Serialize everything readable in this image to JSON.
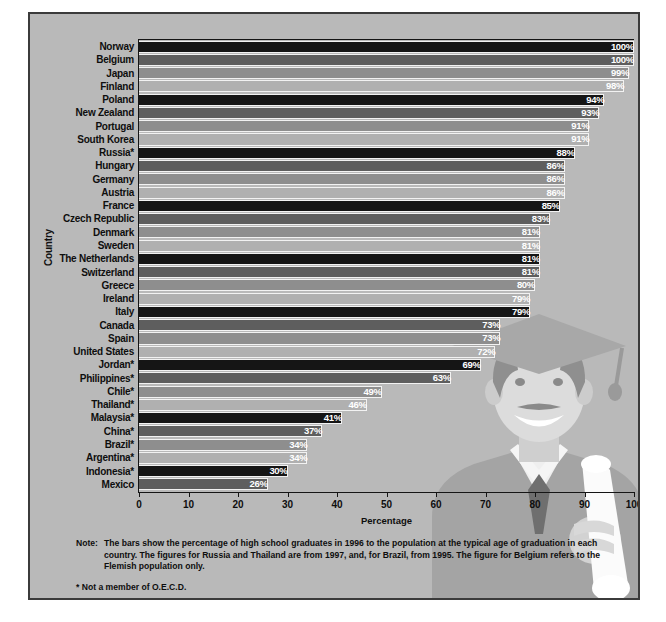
{
  "chart_data": {
    "type": "bar",
    "orientation": "horizontal",
    "title": "",
    "xlabel": "Percentage",
    "ylabel": "Country",
    "xlim": [
      0,
      100
    ],
    "xticks": [
      0,
      10,
      20,
      30,
      40,
      50,
      60,
      70,
      80,
      90,
      100
    ],
    "grid": false,
    "legend": "none",
    "value_suffix": "%",
    "categories": [
      "Norway",
      "Belgium",
      "Japan",
      "Finland",
      "Poland",
      "New Zealand",
      "Portugal",
      "South Korea",
      "Russia*",
      "Hungary",
      "Germany",
      "Austria",
      "France",
      "Czech Republic",
      "Denmark",
      "Sweden",
      "The Netherlands",
      "Switzerland",
      "Greece",
      "Ireland",
      "Italy",
      "Canada",
      "Spain",
      "United States",
      "Jordan*",
      "Philippines*",
      "Chile*",
      "Thailand*",
      "Malaysia*",
      "China*",
      "Brazil*",
      "Argentina*",
      "Indonesia*",
      "Mexico"
    ],
    "values": [
      100,
      100,
      99,
      98,
      94,
      93,
      91,
      91,
      88,
      86,
      86,
      86,
      85,
      83,
      81,
      81,
      81,
      81,
      80,
      79,
      79,
      73,
      73,
      72,
      69,
      63,
      49,
      46,
      41,
      37,
      34,
      34,
      30,
      26
    ],
    "value_labels": [
      "100%",
      "100%",
      "99%",
      "98%",
      "94%",
      "93%",
      "91%",
      "91%",
      "88%",
      "86%",
      "86%",
      "86%",
      "85%",
      "83%",
      "81%",
      "81%",
      "81%",
      "81%",
      "80%",
      "79%",
      "79%",
      "73%",
      "73%",
      "72%",
      "69%",
      "63%",
      "49%",
      "46%",
      "41%",
      "37%",
      "34%",
      "34%",
      "30%",
      "26%"
    ],
    "bar_palette": [
      "#151515",
      "#5e5e5e",
      "#8e8e8e",
      "#b0b0b0"
    ],
    "bar_border_color": "#f2f2f2",
    "plot_background": "#b9b9b9"
  },
  "notes": {
    "note_label": "Note:",
    "note_text": "The bars show the percentage of high school graduates in 1996 to the population at the typical age of graduation in each country. The figures for Russia and Thailand are from 1997, and, for Brazil, from 1995. The figure for Belgium refers to the Flemish population only.",
    "footnote": "* Not a member of O.E.C.D."
  }
}
